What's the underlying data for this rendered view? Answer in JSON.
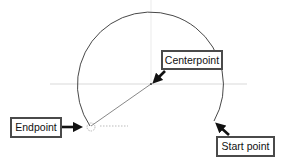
{
  "diagram": {
    "type": "arc-construction",
    "labels": {
      "centerpoint": "Centerpoint",
      "endpoint": "Endpoint",
      "start_point": "Start point"
    },
    "endpoint_tooltip": "R 24.00",
    "colors": {
      "arc": "#333333",
      "guides": "#cccccc",
      "arrow": "#111111",
      "label_border": "#4a4a4a"
    }
  }
}
